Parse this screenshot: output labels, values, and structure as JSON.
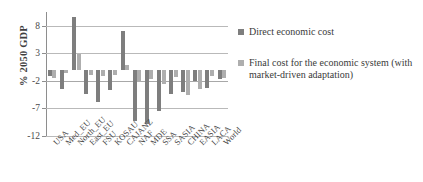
{
  "chart_data": {
    "type": "bar",
    "title": "",
    "xlabel": "",
    "ylabel": "% 2050 GDP",
    "ylim": [
      -12,
      10.5
    ],
    "yticks": [
      8,
      3,
      -2,
      -7,
      -12
    ],
    "ytick_labels": [
      "8",
      "3",
      "-2",
      "-7",
      "-12"
    ],
    "grid": true,
    "legend_position": "right",
    "categories": [
      "USA",
      "Med_EU",
      "North_EU",
      "East_EU",
      "FSU",
      "KOSAU",
      "CAJANZ",
      "NAF",
      "MDE",
      "SSA",
      "SASIA",
      "CHINA",
      "EASIA",
      "LACA",
      "World"
    ],
    "series": [
      {
        "name": "Direct economic cost",
        "color": "#7e7e7e",
        "values": [
          -1.2,
          -3.4,
          9.6,
          -4.3,
          -5.9,
          -3.6,
          7.0,
          -9.3,
          -9.8,
          -7.5,
          -4.4,
          -4.0,
          -2.0,
          -3.3,
          -1.6
        ]
      },
      {
        "name": "Final cost for the economic system (with market-driven adaptation)",
        "color": "#aeaeae",
        "values": [
          -1.4,
          -0.6,
          2.8,
          -1.0,
          -1.1,
          -1.0,
          0.9,
          -2.2,
          -1.6,
          -2.5,
          -1.3,
          -4.6,
          -3.5,
          -1.1,
          -1.5
        ]
      }
    ]
  },
  "legend": {
    "items": [
      {
        "label": "Direct economic cost"
      },
      {
        "label": "Final cost for the economic system (with market-driven adaptation)"
      }
    ]
  },
  "axis": {
    "y_title": "% 2050 GDP"
  }
}
